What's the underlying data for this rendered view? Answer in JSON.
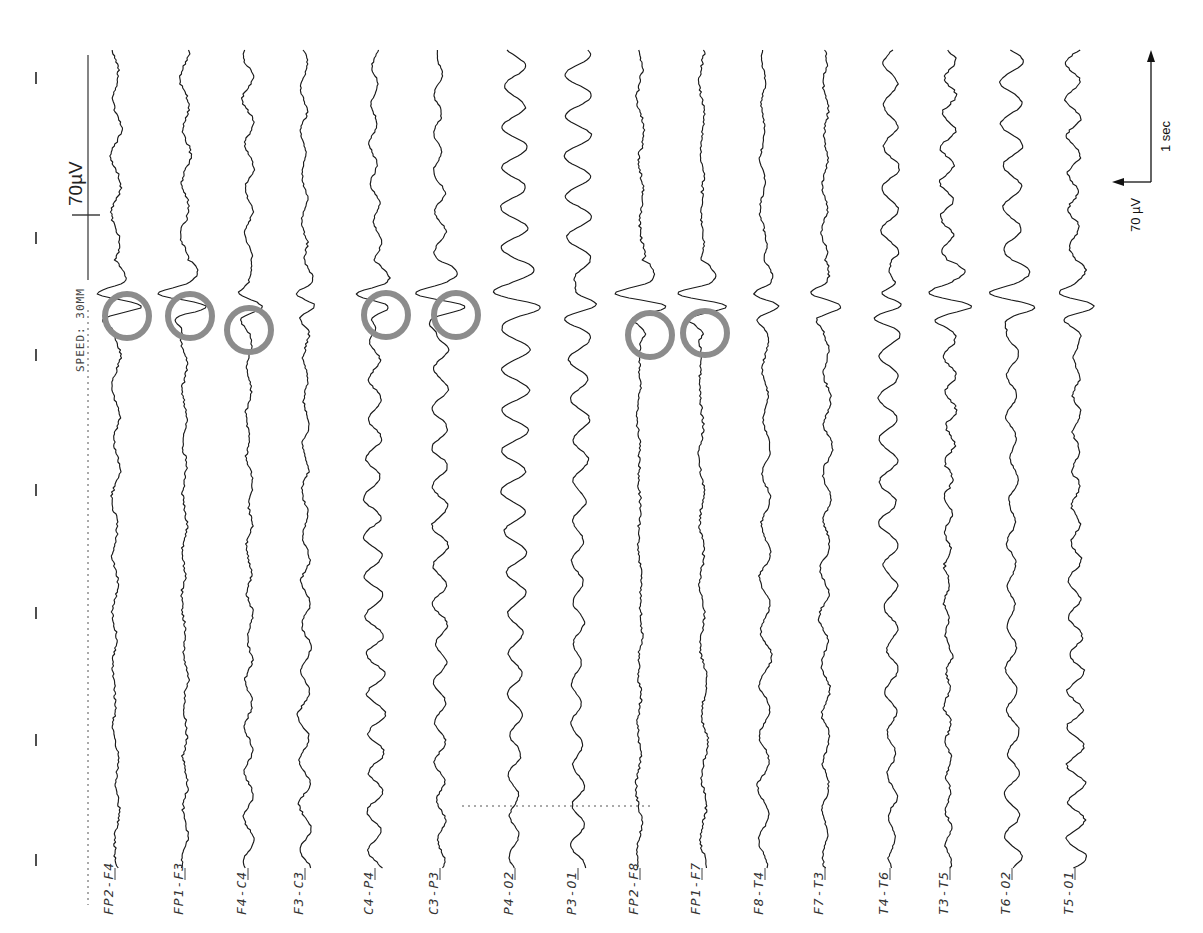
{
  "figure": {
    "orientation": "rotated-90ccw",
    "header": {
      "speed_label": "SPEED: 30MM",
      "calibration_label": "70µV"
    },
    "scale_bar": {
      "time_label": "1 sec",
      "amplitude_label": "70 µV"
    },
    "colors": {
      "trace": "#1a1a1a",
      "circle": "#8c8c8c",
      "background": "#ffffff"
    }
  },
  "channels": [
    {
      "label": "FP2-F4",
      "x": 115,
      "amp": 4,
      "freq": 0.11,
      "noise": 2.2,
      "spike": 8,
      "circle": true
    },
    {
      "label": "FP1-F3",
      "x": 185,
      "amp": 4,
      "freq": 0.12,
      "noise": 2.2,
      "spike": 8,
      "circle": true
    },
    {
      "label": "F4-C4",
      "x": 248,
      "amp": 5,
      "freq": 0.14,
      "noise": 1.8,
      "spike": 4,
      "circle": true
    },
    {
      "label": "F3-C3",
      "x": 305,
      "amp": 5,
      "freq": 0.14,
      "noise": 1.8,
      "spike": 4,
      "circle": false
    },
    {
      "label": "C4-P4",
      "x": 375,
      "amp": 8,
      "freq": 0.16,
      "noise": 1.5,
      "spike": 6,
      "circle": true
    },
    {
      "label": "C3-P3",
      "x": 440,
      "amp": 7,
      "freq": 0.16,
      "noise": 1.5,
      "spike": 7,
      "circle": true
    },
    {
      "label": "P4-O2",
      "x": 515,
      "amp": 13,
      "freq": 0.155,
      "noise": 1.0,
      "spike": 4,
      "circle": false
    },
    {
      "label": "P3-O1",
      "x": 578,
      "amp": 12,
      "freq": 0.155,
      "noise": 1.0,
      "spike": 4,
      "circle": false
    },
    {
      "label": "FP2-F8",
      "x": 640,
      "amp": 3,
      "freq": 0.1,
      "noise": 2.4,
      "spike": 9,
      "circle": true
    },
    {
      "label": "FP1-F7",
      "x": 702,
      "amp": 3,
      "freq": 0.1,
      "noise": 2.4,
      "spike": 9,
      "circle": true
    },
    {
      "label": "F8-T4",
      "x": 765,
      "amp": 5,
      "freq": 0.12,
      "noise": 1.6,
      "spike": 5,
      "circle": false
    },
    {
      "label": "F7-T3",
      "x": 825,
      "amp": 4,
      "freq": 0.13,
      "noise": 2.0,
      "spike": 5,
      "circle": false
    },
    {
      "label": "T4-T6",
      "x": 890,
      "amp": 9,
      "freq": 0.15,
      "noise": 1.3,
      "spike": 6,
      "circle": false
    },
    {
      "label": "T3-T5",
      "x": 950,
      "amp": 6,
      "freq": 0.18,
      "noise": 2.4,
      "spike": 6,
      "circle": false
    },
    {
      "label": "T6-O2",
      "x": 1012,
      "amp": 10,
      "freq": 0.15,
      "noise": 1.2,
      "spike": 6,
      "circle": false
    },
    {
      "label": "T5-O1",
      "x": 1075,
      "amp": 9,
      "freq": 0.17,
      "noise": 2.0,
      "spike": 6,
      "circle": false
    }
  ],
  "circles": [
    {
      "channel": "FP2-F4",
      "cx": 127,
      "cy": 316
    },
    {
      "channel": "FP1-F3",
      "cx": 190,
      "cy": 316
    },
    {
      "channel": "F4-C4",
      "cx": 249,
      "cy": 330
    },
    {
      "channel": "C4-P4",
      "cx": 386,
      "cy": 315
    },
    {
      "channel": "C3-P3",
      "cx": 456,
      "cy": 315
    },
    {
      "channel": "FP2-F8",
      "cx": 650,
      "cy": 335
    },
    {
      "channel": "FP1-F7",
      "cx": 705,
      "cy": 333
    }
  ],
  "time_ticks_y": [
    78,
    238,
    355,
    490,
    613,
    740,
    860
  ],
  "chart_data": {
    "type": "line",
    "title": "",
    "xlabel": "Time",
    "ylabel": "Amplitude (µV)",
    "series": [
      {
        "name": "FP2-F4"
      },
      {
        "name": "FP1-F3"
      },
      {
        "name": "F4-C4"
      },
      {
        "name": "F3-C3"
      },
      {
        "name": "C4-P4"
      },
      {
        "name": "C3-P3"
      },
      {
        "name": "P4-O2"
      },
      {
        "name": "P3-O1"
      },
      {
        "name": "FP2-F8"
      },
      {
        "name": "FP1-F7"
      },
      {
        "name": "F8-T4"
      },
      {
        "name": "F7-T3"
      },
      {
        "name": "T4-T6"
      },
      {
        "name": "T3-T5"
      },
      {
        "name": "T6-O2"
      },
      {
        "name": "T5-O1"
      }
    ],
    "annotations": [
      "SPEED: 30MM",
      "70µV calibration",
      "Scale bar: 1 sec (time), 70 µV (amplitude)",
      "Gray circles mark discharges in FP2-F4, FP1-F3, F4-C4, C4-P4, C3-P3, FP2-F8, FP1-F7"
    ],
    "grid": false,
    "legend": "none"
  }
}
